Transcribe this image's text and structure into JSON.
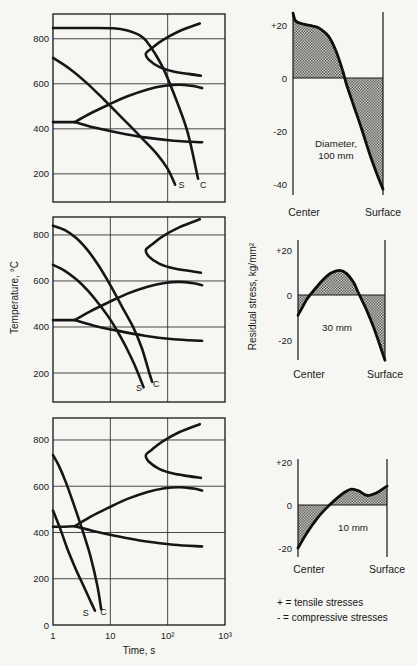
{
  "legend": {
    "line1": "+ = tensile stresses",
    "line2": "- = compressive stresses"
  },
  "chart_data": [
    {
      "id": "cooling-curves-100mm",
      "type": "line",
      "x_scale": "log",
      "xlim": [
        1,
        1000
      ],
      "ylim": [
        75,
        910
      ],
      "xlabel": "",
      "ylabel": "Temperature, °C",
      "x_tick_labels": [],
      "y_ticks": [
        200,
        400,
        600,
        800
      ],
      "grid": true,
      "series": [
        {
          "name": "ms-line",
          "points": [
            [
              0,
              430
            ],
            [
              0.2,
              430
            ],
            [
              0.38,
              430
            ]
          ]
        },
        {
          "name": "transformation-lower-branch",
          "points": [
            [
              0.38,
              430
            ],
            [
              0.7,
              407
            ],
            [
              1.1,
              385
            ],
            [
              1.6,
              362
            ],
            [
              2.1,
              347
            ],
            [
              2.6,
              340
            ]
          ]
        },
        {
          "name": "bainite-start",
          "points": [
            [
              0.38,
              430
            ],
            [
              0.65,
              468
            ],
            [
              0.95,
              505
            ],
            [
              1.3,
              545
            ],
            [
              1.65,
              575
            ],
            [
              1.95,
              591
            ],
            [
              2.2,
              596
            ],
            [
              2.45,
              590
            ],
            [
              2.6,
              581
            ]
          ]
        },
        {
          "name": "pearlite-region",
          "points": [
            [
              2.56,
              868
            ],
            [
              2.2,
              833
            ],
            [
              1.9,
              792
            ],
            [
              1.72,
              757
            ],
            [
              1.62,
              735
            ],
            [
              1.67,
              707
            ],
            [
              1.86,
              674
            ],
            [
              2.1,
              655
            ],
            [
              2.36,
              644
            ],
            [
              2.58,
              636
            ]
          ]
        },
        {
          "name": "surface-cooling",
          "points": [
            [
              0,
              715
            ],
            [
              0.3,
              665
            ],
            [
              0.6,
              601
            ],
            [
              0.9,
              527
            ],
            [
              1.2,
              450
            ],
            [
              1.5,
              372
            ],
            [
              1.8,
              292
            ],
            [
              2.0,
              222
            ],
            [
              2.13,
              152
            ]
          ]
        },
        {
          "name": "center-cooling",
          "points": [
            [
              0,
              848
            ],
            [
              0.55,
              848
            ],
            [
              1.05,
              847
            ],
            [
              1.3,
              837
            ],
            [
              1.5,
              817
            ],
            [
              1.63,
              789
            ],
            [
              1.78,
              734
            ],
            [
              1.95,
              654
            ],
            [
              2.15,
              528
            ],
            [
              2.35,
              383
            ],
            [
              2.53,
              178
            ]
          ]
        }
      ],
      "annotations": [
        {
          "text": "S",
          "x": 2.24,
          "y": 138
        },
        {
          "text": "C",
          "x": 2.62,
          "y": 138
        }
      ]
    },
    {
      "id": "cooling-curves-30mm",
      "type": "line",
      "x_scale": "log",
      "xlim": [
        1,
        1000
      ],
      "ylim": [
        74,
        878
      ],
      "xlabel": "",
      "ylabel": "Temperature, °C",
      "x_tick_labels": [],
      "y_ticks": [
        200,
        400,
        600,
        800
      ],
      "grid": true,
      "series": [
        {
          "name": "ms-line",
          "points": [
            [
              0,
              430
            ],
            [
              0.2,
              430
            ],
            [
              0.38,
              430
            ]
          ]
        },
        {
          "name": "transformation-lower-branch",
          "points": [
            [
              0.38,
              430
            ],
            [
              0.7,
              407
            ],
            [
              1.1,
              385
            ],
            [
              1.6,
              362
            ],
            [
              2.1,
              347
            ],
            [
              2.6,
              340
            ]
          ]
        },
        {
          "name": "bainite-start",
          "points": [
            [
              0.38,
              430
            ],
            [
              0.65,
              468
            ],
            [
              0.95,
              505
            ],
            [
              1.3,
              545
            ],
            [
              1.65,
              575
            ],
            [
              1.95,
              591
            ],
            [
              2.2,
              596
            ],
            [
              2.45,
              590
            ],
            [
              2.6,
              581
            ]
          ]
        },
        {
          "name": "pearlite-region",
          "points": [
            [
              2.56,
              868
            ],
            [
              2.2,
              833
            ],
            [
              1.9,
              792
            ],
            [
              1.72,
              757
            ],
            [
              1.62,
              735
            ],
            [
              1.67,
              707
            ],
            [
              1.86,
              674
            ],
            [
              2.1,
              655
            ],
            [
              2.36,
              644
            ],
            [
              2.58,
              636
            ]
          ]
        },
        {
          "name": "surface-cooling",
          "points": [
            [
              0,
              670
            ],
            [
              0.2,
              645
            ],
            [
              0.4,
              608
            ],
            [
              0.6,
              560
            ],
            [
              0.8,
              500
            ],
            [
              1.0,
              432
            ],
            [
              1.15,
              370
            ],
            [
              1.3,
              300
            ],
            [
              1.45,
              220
            ],
            [
              1.58,
              138
            ]
          ]
        },
        {
          "name": "center-cooling",
          "points": [
            [
              0,
              840
            ],
            [
              0.2,
              822
            ],
            [
              0.4,
              788
            ],
            [
              0.6,
              735
            ],
            [
              0.8,
              665
            ],
            [
              1.0,
              582
            ],
            [
              1.2,
              490
            ],
            [
              1.4,
              398
            ],
            [
              1.55,
              308
            ],
            [
              1.68,
              200
            ],
            [
              1.73,
              162
            ]
          ]
        }
      ],
      "annotations": [
        {
          "text": "S",
          "x": 1.5,
          "y": 122
        },
        {
          "text": "C",
          "x": 1.8,
          "y": 138
        }
      ]
    },
    {
      "id": "cooling-curves-10mm",
      "type": "line",
      "x_scale": "log",
      "xlim": [
        1,
        1000
      ],
      "ylim": [
        0,
        895
      ],
      "xlabel": "Time, s",
      "ylabel": "Temperature, °C",
      "x_tick_labels": [
        "1",
        "10",
        "10²",
        "10³"
      ],
      "y_ticks": [
        0,
        200,
        400,
        600,
        800
      ],
      "grid": true,
      "series": [
        {
          "name": "ms-line",
          "points": [
            [
              0,
              425
            ],
            [
              0.2,
              425
            ],
            [
              0.38,
              427
            ]
          ]
        },
        {
          "name": "transformation-lower-branch",
          "points": [
            [
              0.38,
              427
            ],
            [
              0.7,
              407
            ],
            [
              1.1,
              385
            ],
            [
              1.6,
              362
            ],
            [
              2.1,
              347
            ],
            [
              2.6,
              340
            ]
          ]
        },
        {
          "name": "bainite-start",
          "points": [
            [
              0.38,
              427
            ],
            [
              0.65,
              468
            ],
            [
              0.95,
              505
            ],
            [
              1.3,
              545
            ],
            [
              1.65,
              575
            ],
            [
              1.95,
              591
            ],
            [
              2.2,
              596
            ],
            [
              2.45,
              590
            ],
            [
              2.6,
              581
            ]
          ]
        },
        {
          "name": "pearlite-region",
          "points": [
            [
              2.56,
              868
            ],
            [
              2.2,
              833
            ],
            [
              1.9,
              792
            ],
            [
              1.72,
              757
            ],
            [
              1.62,
              735
            ],
            [
              1.67,
              707
            ],
            [
              1.86,
              674
            ],
            [
              2.1,
              655
            ],
            [
              2.36,
              644
            ],
            [
              2.58,
              636
            ]
          ]
        },
        {
          "name": "surface-cooling",
          "points": [
            [
              0,
              495
            ],
            [
              0.12,
              420
            ],
            [
              0.25,
              330
            ],
            [
              0.4,
              240
            ],
            [
              0.55,
              160
            ],
            [
              0.66,
              100
            ],
            [
              0.73,
              62
            ]
          ]
        },
        {
          "name": "center-cooling",
          "points": [
            [
              0,
              735
            ],
            [
              0.1,
              690
            ],
            [
              0.22,
              620
            ],
            [
              0.35,
              530
            ],
            [
              0.5,
              420
            ],
            [
              0.65,
              300
            ],
            [
              0.77,
              175
            ],
            [
              0.84,
              68
            ]
          ]
        }
      ],
      "annotations": [
        {
          "text": "S",
          "x": 0.57,
          "y": 38
        },
        {
          "text": "C",
          "x": 0.88,
          "y": 44
        }
      ]
    },
    {
      "id": "residual-stress-100mm",
      "type": "area",
      "ylabel": "Residual stress, kg/mm²",
      "xlabel_left": "Center",
      "xlabel_right": "Surface",
      "ylim": [
        -44,
        26
      ],
      "y_ticks": [
        {
          "label": "+20",
          "value": 20
        },
        {
          "label": "0",
          "value": 0
        },
        {
          "label": "-20",
          "value": -20
        },
        {
          "label": "-40",
          "value": -40
        }
      ],
      "annotation": [
        "Diameter,",
        "100 mm"
      ],
      "shading": "hatched area between curve and zero line",
      "curve": [
        [
          0,
          24.5
        ],
        [
          0.03,
          21.5
        ],
        [
          0.12,
          20.3
        ],
        [
          0.22,
          19.6
        ],
        [
          0.3,
          18.6
        ],
        [
          0.4,
          15.5
        ],
        [
          0.48,
          10
        ],
        [
          0.55,
          3
        ],
        [
          0.6,
          -3
        ],
        [
          0.68,
          -11
        ],
        [
          0.76,
          -19
        ],
        [
          0.85,
          -28.5
        ],
        [
          0.93,
          -36
        ],
        [
          1,
          -42
        ]
      ]
    },
    {
      "id": "residual-stress-30mm",
      "type": "area",
      "ylabel": "Residual stress, kg/mm²",
      "xlabel_left": "Center",
      "xlabel_right": "Surface",
      "ylim": [
        -30,
        24
      ],
      "y_ticks": [
        {
          "label": "+20",
          "value": 20
        },
        {
          "label": "0",
          "value": 0
        },
        {
          "label": "-20",
          "value": -20
        }
      ],
      "annotation": [
        "30 mm"
      ],
      "shading": "hatched area between curve and zero line",
      "curve": [
        [
          0,
          -9
        ],
        [
          0.05,
          -5.5
        ],
        [
          0.1,
          -2
        ],
        [
          0.18,
          2
        ],
        [
          0.28,
          6.5
        ],
        [
          0.38,
          9.8
        ],
        [
          0.48,
          11
        ],
        [
          0.56,
          9.5
        ],
        [
          0.64,
          5.5
        ],
        [
          0.7,
          0.5
        ],
        [
          0.78,
          -6
        ],
        [
          0.87,
          -14.5
        ],
        [
          1,
          -29
        ]
      ]
    },
    {
      "id": "residual-stress-10mm",
      "type": "area",
      "ylabel": "Residual stress, kg/mm²",
      "xlabel_left": "Center",
      "xlabel_right": "Surface",
      "ylim": [
        -24,
        22
      ],
      "y_ticks": [
        {
          "label": "+20",
          "value": 20
        },
        {
          "label": "0",
          "value": 0
        },
        {
          "label": "-20",
          "value": -20
        }
      ],
      "annotation": [
        "10 mm"
      ],
      "shading": "hatched area between curve and zero line",
      "curve": [
        [
          0,
          -20
        ],
        [
          0.1,
          -13
        ],
        [
          0.22,
          -6
        ],
        [
          0.33,
          -1
        ],
        [
          0.42,
          2.5
        ],
        [
          0.52,
          5.8
        ],
        [
          0.6,
          7.4
        ],
        [
          0.68,
          6.6
        ],
        [
          0.78,
          4.4
        ],
        [
          0.88,
          5.6
        ],
        [
          1,
          8.8
        ]
      ]
    }
  ]
}
